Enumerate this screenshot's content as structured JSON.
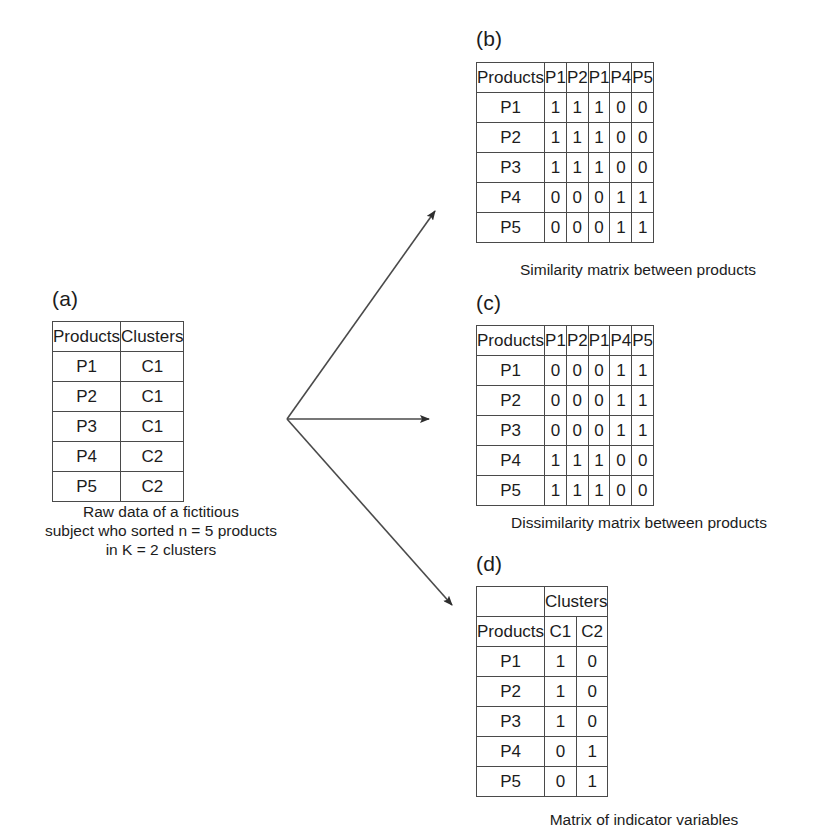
{
  "figure": {
    "panels": [
      {
        "id": "a",
        "label": "(a)",
        "caption": "Raw data of a fictitious\nsubject who sorted n = 5 products\nin K = 2 clusters",
        "headers": [
          "Products",
          "Clusters"
        ],
        "rows": [
          [
            "P1",
            "C1"
          ],
          [
            "P2",
            "C1"
          ],
          [
            "P3",
            "C1"
          ],
          [
            "P4",
            "C2"
          ],
          [
            "P5",
            "C2"
          ]
        ]
      },
      {
        "id": "b",
        "label": "(b)",
        "caption": "Similarity matrix between products",
        "headers": [
          "Products",
          "P1",
          "P2",
          "P1",
          "P4",
          "P5"
        ],
        "rows": [
          [
            "P1",
            "1",
            "1",
            "1",
            "0",
            "0"
          ],
          [
            "P2",
            "1",
            "1",
            "1",
            "0",
            "0"
          ],
          [
            "P3",
            "1",
            "1",
            "1",
            "0",
            "0"
          ],
          [
            "P4",
            "0",
            "0",
            "0",
            "1",
            "1"
          ],
          [
            "P5",
            "0",
            "0",
            "0",
            "1",
            "1"
          ]
        ]
      },
      {
        "id": "c",
        "label": "(c)",
        "caption": "Dissimilarity matrix between products",
        "headers": [
          "Products",
          "P1",
          "P2",
          "P1",
          "P4",
          "P5"
        ],
        "rows": [
          [
            "P1",
            "0",
            "0",
            "0",
            "1",
            "1"
          ],
          [
            "P2",
            "0",
            "0",
            "0",
            "1",
            "1"
          ],
          [
            "P3",
            "0",
            "0",
            "0",
            "1",
            "1"
          ],
          [
            "P4",
            "1",
            "1",
            "1",
            "0",
            "0"
          ],
          [
            "P5",
            "1",
            "1",
            "1",
            "0",
            "0"
          ]
        ]
      },
      {
        "id": "d",
        "label": "(d)",
        "caption": "Matrix of indicator variables",
        "group_header": {
          "corner": "",
          "span_label": "Clusters"
        },
        "headers": [
          "Products",
          "C1",
          "C2"
        ],
        "rows": [
          [
            "P1",
            "1",
            "0"
          ],
          [
            "P2",
            "1",
            "0"
          ],
          [
            "P3",
            "1",
            "0"
          ],
          [
            "P4",
            "0",
            "1"
          ],
          [
            "P5",
            "0",
            "1"
          ]
        ]
      }
    ],
    "arrows": [
      {
        "name": "arrow-to-similarity-matrix",
        "from": [
          287,
          419
        ],
        "to": [
          441,
          204
        ]
      },
      {
        "name": "arrow-to-dissimilarity-matrix",
        "from": [
          287,
          419
        ],
        "to": [
          437,
          419
        ]
      },
      {
        "name": "arrow-to-indicator-matrix",
        "from": [
          287,
          419
        ],
        "to": [
          459,
          612
        ]
      }
    ],
    "colors": {
      "line": "#4a4a4a",
      "arrow": "#3a3a3a",
      "text": "#1c1c1c",
      "background": "#ffffff"
    }
  }
}
